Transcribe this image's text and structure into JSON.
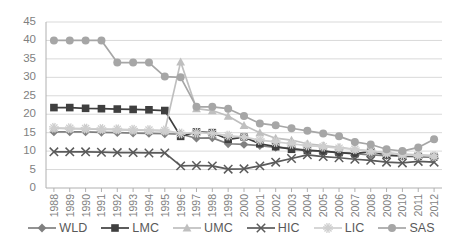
{
  "chart_data": {
    "type": "line",
    "title": "",
    "xlabel": "",
    "ylabel": "",
    "ylim": [
      0,
      45
    ],
    "ytick_step": 5,
    "grid": true,
    "legend_position": "bottom",
    "categories": [
      "1988",
      "1989",
      "1990",
      "1991",
      "1992",
      "1993",
      "1994",
      "1995",
      "1996",
      "1997",
      "1998",
      "1999",
      "2000",
      "2001",
      "2002",
      "2003",
      "2004",
      "2005",
      "2006",
      "2007",
      "2008",
      "2009",
      "2010",
      "2011",
      "2012"
    ],
    "yticks": [
      "0",
      "5",
      "10",
      "15",
      "20",
      "25",
      "30",
      "35",
      "40",
      "45"
    ],
    "series": [
      {
        "name": "WLD",
        "marker": "diamond",
        "color": "#808080",
        "values": [
          15.2,
          15.2,
          15.2,
          15.1,
          15.0,
          14.9,
          14.8,
          14.7,
          14.6,
          13.5,
          13.6,
          12.0,
          11.8,
          11.5,
          11.0,
          10.8,
          10.2,
          10.0,
          9.5,
          9.3,
          9.0,
          8.8,
          8.6,
          8.5,
          8.4
        ]
      },
      {
        "name": "LMC",
        "marker": "square",
        "color": "#3f3f3f",
        "values": [
          21.8,
          21.8,
          21.6,
          21.5,
          21.4,
          21.3,
          21.2,
          21.0,
          14.0,
          15.2,
          15.0,
          13.2,
          13.8,
          12.0,
          11.2,
          10.5,
          10.2,
          10.0,
          9.6,
          9.3,
          9.9,
          9.0,
          8.8,
          8.6,
          8.5
        ]
      },
      {
        "name": "UMC",
        "marker": "triangle",
        "color": "#bfbfbf",
        "values": [
          16.2,
          16.1,
          16.0,
          15.9,
          15.8,
          15.7,
          15.6,
          15.5,
          34.2,
          21.5,
          21.0,
          19.5,
          17.0,
          15.0,
          13.5,
          13.0,
          12.0,
          11.5,
          11.0,
          10.5,
          10.0,
          9.5,
          9.2,
          9.0,
          8.8
        ]
      },
      {
        "name": "HIC",
        "marker": "x",
        "color": "#5a5a5a",
        "values": [
          9.8,
          9.8,
          9.8,
          9.7,
          9.6,
          9.6,
          9.5,
          9.5,
          6.0,
          6.1,
          6.0,
          5.1,
          5.2,
          6.0,
          7.0,
          8.0,
          9.0,
          8.5,
          8.2,
          7.8,
          7.5,
          7.0,
          6.8,
          7.2,
          7.0
        ]
      },
      {
        "name": "LIC",
        "marker": "star",
        "color": "#cfcfcf",
        "values": [
          16.3,
          16.2,
          16.1,
          16.0,
          15.9,
          15.8,
          15.7,
          15.6,
          14.8,
          15.0,
          14.8,
          14.2,
          13.8,
          13.0,
          12.5,
          12.0,
          11.5,
          11.2,
          10.8,
          10.5,
          10.0,
          9.5,
          9.0,
          8.8,
          8.6
        ]
      },
      {
        "name": "SAS",
        "marker": "circle",
        "color": "#a6a6a6",
        "values": [
          40.0,
          40.0,
          40.0,
          40.0,
          34.0,
          34.0,
          34.0,
          30.2,
          30.0,
          22.0,
          22.0,
          21.5,
          19.5,
          17.5,
          17.0,
          16.2,
          15.5,
          14.8,
          14.0,
          12.5,
          11.8,
          10.5,
          10.0,
          11.0,
          13.2
        ]
      }
    ]
  },
  "legend": {
    "items": [
      {
        "label": "WLD",
        "marker": "diamond",
        "color": "#808080"
      },
      {
        "label": "LMC",
        "marker": "square",
        "color": "#3f3f3f"
      },
      {
        "label": "UMC",
        "marker": "triangle",
        "color": "#bfbfbf"
      },
      {
        "label": "HIC",
        "marker": "x",
        "color": "#5a5a5a"
      },
      {
        "label": "LIC",
        "marker": "star",
        "color": "#cfcfcf"
      },
      {
        "label": "SAS",
        "marker": "circle",
        "color": "#a6a6a6"
      }
    ]
  }
}
